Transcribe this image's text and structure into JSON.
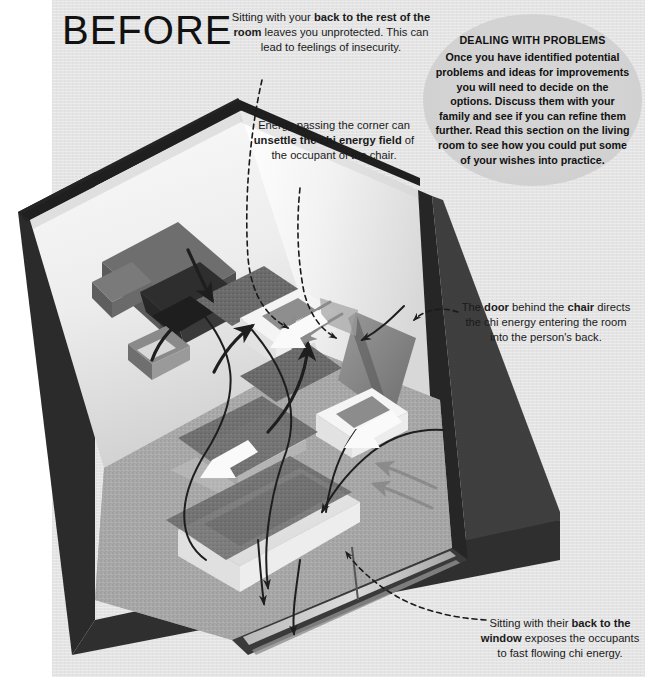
{
  "page": {
    "title": "BEFORE",
    "background_color": "#e4e4e4",
    "gutter_color": "#ffffff",
    "ink_color": "#1a1a1a"
  },
  "callouts": [
    {
      "id": "back-to-room",
      "text": "Sitting with your back to the rest of the room leaves you unprotected. This can lead to feelings of insecurity.",
      "bold_phrases": [
        "back",
        "to the rest of the room"
      ]
    },
    {
      "id": "corner-chi",
      "text": "Energy passing the corner can unsettle the chi energy field of the occupant of the chair.",
      "bold_phrases": [
        "unsettle",
        "the chi energy field"
      ]
    },
    {
      "id": "door-behind-chair",
      "text": "The door behind the chair directs the chi energy entering the room into the person's back.",
      "bold_phrases": [
        "door",
        "chair"
      ]
    },
    {
      "id": "back-to-window",
      "text": "Sitting with their back to the window exposes the occupants to fast flowing chi energy.",
      "bold_phrases": [
        "back to the",
        "window"
      ]
    }
  ],
  "tipbox": {
    "heading": "DEALING WITH PROBLEMS",
    "body": "Once you have identified potential problems and ideas for improvements you will need to decide on the options. Discuss them with your family and see if you can refine them further. Read this section on the living room to see how you could put some of your wishes into practice.",
    "background_color": "#d2d2d2",
    "shape": "ellipse"
  },
  "scene": {
    "name": "isometric-living-room-cutaway",
    "description": "Cutaway 3-D living room seen from above with two walls, carpeted floor, a sofa, two armchairs, a coffee table, a sideboard, a TV unit, a door and a window. Curved and straight arrows trace the flow of chi energy through the room.",
    "colors": {
      "wall_light": "#f3f3f3",
      "wall_shadow": "#cfcfcf",
      "frame_dark": "#2a2a2a",
      "carpet": "#a8a8a8",
      "furniture_dark": "#6f6f6f",
      "furniture_mid": "#8d8d8d",
      "furniture_light": "#e9e9e9",
      "arrow": "#1e1e1e"
    },
    "items": [
      "wall-back-left",
      "wall-back-right",
      "floor-carpet",
      "sideboard",
      "tv-unit",
      "armchair-top",
      "armchair-right",
      "sofa",
      "coffee-table",
      "door",
      "window",
      "chi-flow-arrows"
    ]
  }
}
